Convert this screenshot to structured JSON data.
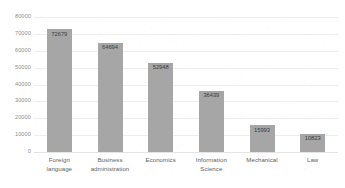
{
  "chart_data": {
    "type": "bar",
    "title": "",
    "subtitle": "",
    "xlabel": "",
    "ylabel": "",
    "orientation": "vertical",
    "categories": [
      "Foreign language",
      "Business administration",
      "Economics",
      "Information Science",
      "Mechanical",
      "Law"
    ],
    "category_lines": [
      [
        "Foreign",
        "language"
      ],
      [
        "Business",
        "administration"
      ],
      [
        "Economics"
      ],
      [
        "Information",
        "Science"
      ],
      [
        "Mechanical"
      ],
      [
        "Law"
      ]
    ],
    "values": [
      72679,
      64694,
      52948,
      36439,
      15993,
      10823
    ],
    "value_labels": [
      "72679",
      "64694",
      "52948",
      "36439",
      "15993",
      "10823"
    ],
    "ylim": [
      0,
      80000
    ],
    "ytick_step": 10000,
    "ytick_labels": [
      "80000",
      "70000",
      "60000",
      "50000",
      "40000",
      "30000",
      "20000",
      "10000",
      "0"
    ],
    "ytick_values": [
      80000,
      70000,
      60000,
      50000,
      40000,
      30000,
      20000,
      10000,
      0
    ],
    "grid": true,
    "grid_axis": "y",
    "legend": false,
    "legend_position": "none",
    "data_labels_inside_bars": true,
    "colors": {
      "bar_fill": "#a6a6a6",
      "gridline": "#ededed",
      "baseline": "#e4e4e4",
      "ytick_text": "#8d8d8d",
      "xlabel_text": "#5e5e5e",
      "value_label_text": "#3d3d3d",
      "background": "#ffffff"
    }
  }
}
